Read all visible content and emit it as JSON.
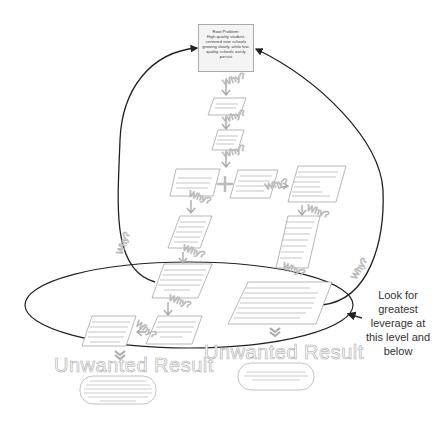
{
  "root_problem": {
    "title": "Root Problem:",
    "text": "High-quality student-centered new schools growing slowly, while low-quality schools easily persist"
  },
  "why_label": "Why?",
  "callout": {
    "text": "Look for greatest leverage at this level and below"
  },
  "unwanted_results": [
    {
      "label": "Unwanted Result"
    },
    {
      "label": "Unwanted Result"
    }
  ],
  "chain_boxes": [
    {
      "id": "b1",
      "position": "center-top"
    },
    {
      "id": "b2",
      "position": "center-second"
    },
    {
      "id": "b3",
      "position": "left-third"
    },
    {
      "id": "b4",
      "position": "middle-third"
    },
    {
      "id": "b5",
      "position": "right-third-list"
    },
    {
      "id": "b6",
      "position": "left-fourth"
    },
    {
      "id": "b7",
      "position": "right-fourth"
    },
    {
      "id": "b8",
      "position": "left-fifth"
    },
    {
      "id": "b9",
      "position": "right-fifth-list"
    },
    {
      "id": "b10",
      "position": "left-sixth"
    },
    {
      "id": "b11",
      "position": "far-left-sixth"
    }
  ],
  "colors": {
    "box_border": "#999999",
    "arrow_gray": "#b0b0b0",
    "loop_line": "#222222",
    "root_fill": "#f4f4f4"
  }
}
